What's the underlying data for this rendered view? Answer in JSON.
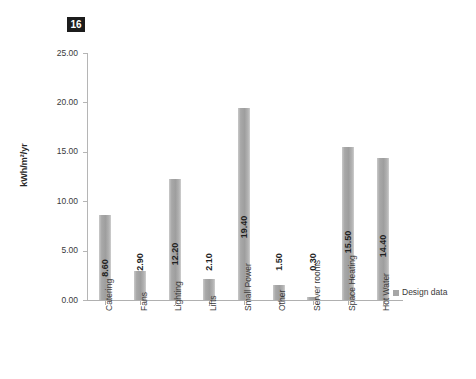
{
  "figure": {
    "badge_number": "16"
  },
  "legend": {
    "position": "right",
    "entries": [
      {
        "label": "Design data",
        "color": "#a6a6a6"
      }
    ]
  },
  "axis": {
    "y_title": "kWh/m²/yr",
    "y_ticks": [
      "0.00",
      "5.00",
      "10.00",
      "15.00",
      "20.00",
      "25.00"
    ]
  },
  "chart_data": {
    "type": "bar",
    "title": "",
    "subtitle": "",
    "xlabel": "",
    "ylabel": "kWh/m²/yr",
    "ylim": [
      0,
      25
    ],
    "ytick_values": [
      0,
      5,
      10,
      15,
      20,
      25
    ],
    "ytick_labels": [
      "0.00",
      "5.00",
      "10.00",
      "15.00",
      "20.00",
      "25.00"
    ],
    "grid": false,
    "legend_position": "right",
    "bar_color": "#a6a6a6",
    "categories": [
      "Catering",
      "Fans",
      "Lighting",
      "Lifts",
      "Small Power",
      "Other",
      "Server rooms",
      "Space Heating",
      "Hot Water"
    ],
    "series": [
      {
        "name": "Design data",
        "values": [
          8.6,
          2.9,
          12.2,
          2.1,
          19.4,
          1.5,
          0.3,
          15.5,
          14.4
        ]
      }
    ],
    "data_labels": [
      "8.60",
      "2.90",
      "12.20",
      "2.10",
      "19.40",
      "1.50",
      "0.30",
      "15.50",
      "14.40"
    ]
  }
}
